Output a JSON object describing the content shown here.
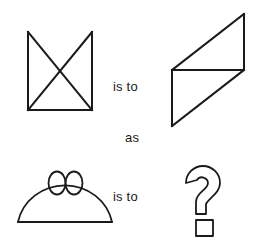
{
  "puzzle": {
    "type": "visual-analogy",
    "connector_1": "is to",
    "connector_2": "as",
    "connector_3": "is to",
    "background_color": "#ffffff",
    "ink_color": "#1a1a1a"
  },
  "figures": {
    "a": {
      "name": "square-with-x-open-top",
      "description": "Square missing its top edge with both diagonals drawn forming an X",
      "position": "top-left"
    },
    "b": {
      "name": "rotated-parallelogram-with-diagonal",
      "description": "Parallelogram tilted with a horizontal midline creating two triangles",
      "position": "top-right"
    },
    "c": {
      "name": "dome-with-two-ellipses",
      "description": "Semicircular dome on a baseline with two small ellipses at the apex",
      "position": "bottom-left"
    },
    "d": {
      "name": "question-mark",
      "description": "Outlined question mark with square dot indicating the unknown answer",
      "position": "bottom-right"
    }
  }
}
